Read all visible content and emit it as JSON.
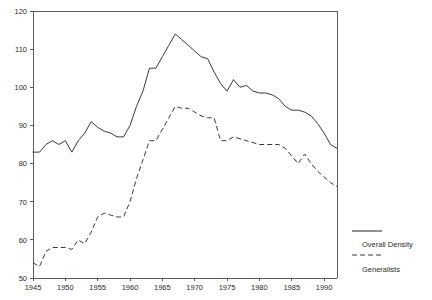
{
  "chart_data": {
    "type": "line",
    "title": "",
    "subtitle": "",
    "xlabel": "",
    "ylabel": "",
    "xlim": [
      1945,
      1992
    ],
    "ylim": [
      50,
      120
    ],
    "grid": false,
    "legend_position": "right-outside",
    "y_ticks": [
      50,
      60,
      70,
      80,
      90,
      100,
      110,
      120
    ],
    "y_tick_labels": [
      "50",
      "60",
      "70",
      "80",
      "90",
      "100",
      "110",
      "120"
    ],
    "x_ticks": [
      1945,
      1950,
      1955,
      1960,
      1965,
      1970,
      1975,
      1980,
      1985,
      1990
    ],
    "x_tick_labels": [
      "1945",
      "1950",
      "1955",
      "1960",
      "1965",
      "1970",
      "1975",
      "1980",
      "1985",
      "1990"
    ],
    "x": [
      1945,
      1946,
      1947,
      1948,
      1949,
      1950,
      1951,
      1952,
      1953,
      1954,
      1955,
      1956,
      1957,
      1958,
      1959,
      1960,
      1961,
      1962,
      1963,
      1964,
      1965,
      1966,
      1967,
      1968,
      1969,
      1970,
      1971,
      1972,
      1973,
      1974,
      1975,
      1976,
      1977,
      1978,
      1979,
      1980,
      1981,
      1982,
      1983,
      1984,
      1985,
      1986,
      1987,
      1988,
      1989,
      1990,
      1991,
      1992
    ],
    "series": [
      {
        "name": "Overall Density",
        "style": "solid",
        "color": "#3a3a3a",
        "values": [
          83,
          83,
          85,
          86,
          85,
          86,
          83,
          86,
          88,
          91,
          89.5,
          88.5,
          88,
          87,
          87,
          90,
          95,
          99,
          105,
          105,
          108,
          111,
          114,
          112.5,
          111,
          109.5,
          108,
          107.5,
          104,
          101,
          99,
          102,
          100,
          100.5,
          99,
          98.5,
          98.5,
          98,
          97,
          95,
          94,
          94,
          93.5,
          92.5,
          90.5,
          88,
          85,
          84
        ]
      },
      {
        "name": "Generalists",
        "style": "dashed",
        "color": "#3a3a3a",
        "values": [
          54,
          53,
          57,
          58,
          58,
          58,
          57.5,
          60,
          59,
          62,
          66,
          67,
          66.5,
          66,
          66,
          70,
          76,
          81,
          86,
          86,
          89,
          92,
          95,
          94.5,
          94.5,
          93.5,
          92.5,
          92,
          92,
          86,
          86,
          87,
          86.5,
          86,
          85.5,
          85,
          85,
          85,
          85,
          84,
          82,
          80,
          82.5,
          80,
          78,
          76.5,
          75,
          74
        ]
      }
    ],
    "legend": [
      {
        "label": "Overall Density",
        "style": "solid"
      },
      {
        "label": "Generalists",
        "style": "dashed"
      }
    ]
  }
}
